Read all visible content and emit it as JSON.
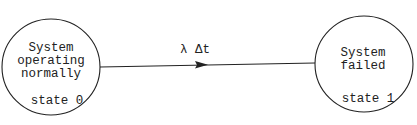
{
  "diagram": {
    "states": [
      {
        "id": "state0",
        "lines": [
          "System",
          "operating",
          "normally"
        ],
        "label": "state 0"
      },
      {
        "id": "state1",
        "lines": [
          "System",
          "failed"
        ],
        "label": "state 1"
      }
    ],
    "transition": {
      "from": "state0",
      "to": "state1",
      "label": "λ Δt"
    },
    "colors": {
      "stroke": "#222222",
      "background": "#ffffff"
    }
  }
}
